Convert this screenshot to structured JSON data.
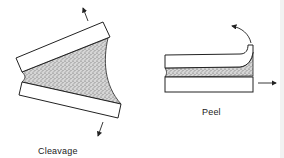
{
  "figure": {
    "panels": [
      {
        "id": "cleavage",
        "label": "Cleavage",
        "description": "Two rigid adherends bonded by adhesive, pulled apart at one end in opposite directions"
      },
      {
        "id": "peel",
        "label": "Peel",
        "description": "Flexible top adherend peeled upward from rigid bottom adherend, bottom pulled to the right"
      }
    ],
    "colors": {
      "line": "#222222",
      "adhesive_fill": "#b8b8b8",
      "background": "#ffffff"
    }
  }
}
